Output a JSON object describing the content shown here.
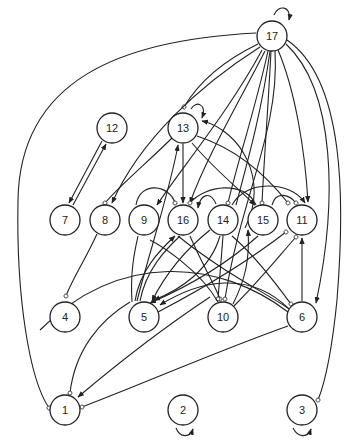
{
  "diagram": {
    "type": "directed-graph",
    "node_radius": 15,
    "colors": {
      "stroke": "#222222",
      "background": "#ffffff"
    },
    "nodes": [
      {
        "id": "17",
        "label": "17",
        "x": 272,
        "y": 36
      },
      {
        "id": "12",
        "label": "12",
        "x": 112,
        "y": 128
      },
      {
        "id": "13",
        "label": "13",
        "x": 183,
        "y": 128
      },
      {
        "id": "7",
        "label": "7",
        "x": 65,
        "y": 220
      },
      {
        "id": "8",
        "label": "8",
        "x": 105,
        "y": 220
      },
      {
        "id": "9",
        "label": "9",
        "x": 144,
        "y": 220
      },
      {
        "id": "16",
        "label": "16",
        "x": 183,
        "y": 220
      },
      {
        "id": "14",
        "label": "14",
        "x": 223,
        "y": 220
      },
      {
        "id": "15",
        "label": "15",
        "x": 263,
        "y": 220
      },
      {
        "id": "11",
        "label": "11",
        "x": 302,
        "y": 220
      },
      {
        "id": "4",
        "label": "4",
        "x": 65,
        "y": 317
      },
      {
        "id": "5",
        "label": "5",
        "x": 144,
        "y": 317
      },
      {
        "id": "10",
        "label": "10",
        "x": 223,
        "y": 317
      },
      {
        "id": "6",
        "label": "6",
        "x": 302,
        "y": 317
      },
      {
        "id": "1",
        "label": "1",
        "x": 65,
        "y": 410
      },
      {
        "id": "2",
        "label": "2",
        "x": 183,
        "y": 410
      },
      {
        "id": "3",
        "label": "3",
        "x": 302,
        "y": 410
      }
    ],
    "self_loops": [
      "17",
      "13",
      "2",
      "3"
    ],
    "edges": [
      {
        "from": "17",
        "to": "1",
        "end": "circle"
      },
      {
        "from": "17",
        "to": "13",
        "end": "circle"
      },
      {
        "from": "17",
        "to": "8",
        "end": "arrow"
      },
      {
        "from": "17",
        "to": "16",
        "end": "arrow"
      },
      {
        "from": "17",
        "to": "14",
        "end": "circle"
      },
      {
        "from": "17",
        "to": "9",
        "end": "arrow"
      },
      {
        "from": "17",
        "to": "15",
        "end": "circle"
      },
      {
        "from": "17",
        "to": "11",
        "end": "arrow"
      },
      {
        "from": "17",
        "to": "6",
        "end": "arrow"
      },
      {
        "from": "17",
        "to": "3",
        "end": "circle"
      },
      {
        "from": "12",
        "to": "7",
        "end": "arrow"
      },
      {
        "from": "7",
        "to": "12",
        "end": "arrow"
      },
      {
        "from": "13",
        "to": "8",
        "end": "circle"
      },
      {
        "from": "13",
        "to": "16",
        "end": "arrow"
      },
      {
        "from": "13",
        "to": "11",
        "end": "circle"
      },
      {
        "from": "14",
        "to": "13",
        "end": "arrow"
      },
      {
        "from": "5",
        "to": "13",
        "end": "arrow"
      },
      {
        "from": "9",
        "to": "16",
        "end": "circle"
      },
      {
        "from": "14",
        "to": "16",
        "end": "arrow"
      },
      {
        "from": "15",
        "to": "16",
        "end": "circle"
      },
      {
        "from": "15",
        "to": "11",
        "end": "circle"
      },
      {
        "from": "14",
        "to": "11",
        "end": "arrow"
      },
      {
        "from": "8",
        "to": "4",
        "end": "circle"
      },
      {
        "from": "5",
        "to": "16",
        "end": "arrow"
      },
      {
        "from": "16",
        "to": "10",
        "end": "circle"
      },
      {
        "from": "16",
        "to": "6",
        "end": "circle"
      },
      {
        "from": "14",
        "to": "5",
        "end": "arrow"
      },
      {
        "from": "14",
        "to": "10",
        "end": "circle"
      },
      {
        "from": "14",
        "to": "1",
        "end": "arrow"
      },
      {
        "from": "14",
        "to": "6",
        "end": "circle"
      },
      {
        "from": "11",
        "to": "5",
        "end": "circle"
      },
      {
        "from": "11",
        "to": "10",
        "end": "circle"
      },
      {
        "from": "15",
        "to": "5",
        "end": "arrow"
      },
      {
        "from": "6",
        "to": "11",
        "end": "arrow"
      },
      {
        "from": "6",
        "to": "5",
        "end": "arrow"
      },
      {
        "from": "6",
        "to": "1",
        "end": "circle"
      },
      {
        "from": "5",
        "to": "1",
        "end": "circle"
      },
      {
        "from": "10",
        "to": "14",
        "end": "arrow"
      }
    ]
  }
}
